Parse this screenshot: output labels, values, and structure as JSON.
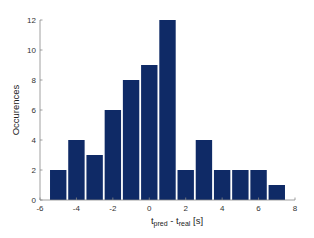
{
  "chart_data": {
    "type": "bar",
    "title": "",
    "xlabel": "t_pred - t_real [s]",
    "xlabel_parts": {
      "t1": "t",
      "sub1": "pred",
      "mid": " - t",
      "sub2": "real",
      "unit": " [s]"
    },
    "ylabel": "Occurences",
    "categories": [
      -5,
      -4,
      -3,
      -2,
      -1,
      0,
      1,
      2,
      3,
      4,
      5,
      6,
      7
    ],
    "values": [
      2,
      4,
      3,
      6,
      8,
      9,
      12,
      2,
      4,
      2,
      2,
      2,
      1
    ],
    "xlim": [
      -6,
      8
    ],
    "ylim": [
      0,
      12
    ],
    "xticks": [
      -6,
      -4,
      -2,
      0,
      2,
      4,
      6,
      8
    ],
    "yticks": [
      0,
      2,
      4,
      6,
      8,
      10,
      12
    ],
    "bar_width": 0.9,
    "bar_color": "#0f2a66",
    "grid": false,
    "legend": null
  }
}
